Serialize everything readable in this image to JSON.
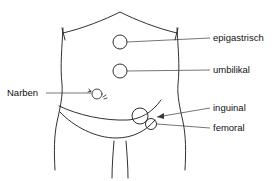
{
  "diagram": {
    "stroke_color": "#1a1a1a",
    "leader_color": "#3a3a3a",
    "background_color": "#ffffff",
    "labels": {
      "epigastrisch": "epigastrisch",
      "umbilikal": "umbilikal",
      "inguinal": "inguinal",
      "femoral": "femoral",
      "narben": "Narben"
    },
    "sites": [
      {
        "id": "epigastrisch",
        "label": "epigastrisch",
        "shape": "circle",
        "cx": 120,
        "cy": 42,
        "r": 7
      },
      {
        "id": "umbilikal",
        "label": "umbilikal",
        "shape": "circle",
        "cx": 120,
        "cy": 71,
        "r": 7
      },
      {
        "id": "inguinal",
        "label": "inguinal",
        "shape": "circle",
        "cx": 140,
        "cy": 116,
        "r": 8
      },
      {
        "id": "femoral",
        "label": "femoral",
        "shape": "circle",
        "cx": 151,
        "cy": 124,
        "r": 5.5
      },
      {
        "id": "narben",
        "label": "Narben",
        "shape": "scar-circle",
        "cx": 97,
        "cy": 94,
        "r": 5
      }
    ]
  }
}
